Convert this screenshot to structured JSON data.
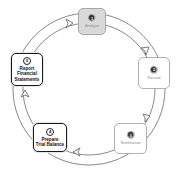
{
  "diagram": {
    "type": "cycle",
    "direction": "clockwise",
    "colors": {
      "ring_stroke": "#7a7a7a",
      "active_border": "#1a1a1a",
      "faded_border": "#b0b0b0",
      "faded_fill": "#d9d9d9",
      "faded_text": "#8c8c8c"
    },
    "steps": [
      {
        "number": "1",
        "label": "Analyze",
        "state": "faded",
        "position": "top"
      },
      {
        "number": "2",
        "label": "Record",
        "state": "faded",
        "position": "right-upper"
      },
      {
        "number": "3",
        "label": "Summarize",
        "state": "faded",
        "position": "right-lower"
      },
      {
        "number": "4",
        "label": "Prepare\nTrial Balance",
        "state": "active",
        "position": "bottom-left"
      },
      {
        "number": "5",
        "label": "Report\nFinancial\nStatements",
        "state": "active",
        "position": "left"
      }
    ],
    "arrows": [
      {
        "from": "5",
        "to": "1",
        "icon": "chevron-arrow-icon"
      },
      {
        "from": "1",
        "to": "2",
        "icon": "chevron-arrow-icon"
      },
      {
        "from": "2",
        "to": "3",
        "icon": "chevron-arrow-icon"
      },
      {
        "from": "3",
        "to": "4",
        "icon": "chevron-arrow-icon"
      },
      {
        "from": "4",
        "to": "5",
        "icon": "chevron-arrow-icon"
      }
    ]
  }
}
